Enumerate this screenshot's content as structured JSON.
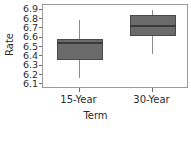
{
  "chart_data": {
    "type": "box",
    "title": "",
    "xlabel": "Term",
    "ylabel": "Rate",
    "categories": [
      "15-Year",
      "30-Year"
    ],
    "ylim": [
      6.05,
      6.95
    ],
    "yticks": [
      6.1,
      6.2,
      6.3,
      6.4,
      6.5,
      6.6,
      6.7,
      6.8,
      6.9
    ],
    "ytick_labels": [
      "6.1",
      "6.2",
      "6.3",
      "6.4",
      "6.5",
      "6.6",
      "6.7",
      "6.8",
      "6.9"
    ],
    "grid": false,
    "legend": "none",
    "box_fill_color": "#6b6b6b",
    "box_edge_color": "#4a4a4a",
    "median_color": "#3a3a3a",
    "whisker_color": "#8a8a8a",
    "frame_color": "#9a9a9a",
    "boxes": [
      {
        "category": "15-Year",
        "whisker_low": 6.17,
        "q1": 6.36,
        "median": 6.54,
        "q3": 6.59,
        "whisker_high": 6.79
      },
      {
        "category": "30-Year",
        "whisker_low": 6.42,
        "q1": 6.62,
        "median": 6.72,
        "q3": 6.84,
        "whisker_high": 6.9
      }
    ]
  }
}
